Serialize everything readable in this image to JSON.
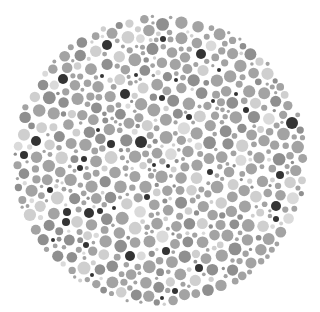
{
  "plate": {
    "type": "color-vision-test-plate",
    "rendering": "grayscale",
    "width": 318,
    "height": 312,
    "background": "#ffffff",
    "center": [
      160,
      160
    ],
    "radius_x": 148,
    "radius_y": 146,
    "palette": {
      "dark": "#343434",
      "mid": "#a3a3a3",
      "mid_dark": "#8f8f8f",
      "light": "#cfcfcf",
      "lighter": "#dadada"
    },
    "dark_dots": [
      [
        107,
        45,
        5
      ],
      [
        163,
        39,
        3
      ],
      [
        201,
        54,
        5
      ],
      [
        63,
        79,
        5
      ],
      [
        125,
        94,
        5
      ],
      [
        162,
        98,
        3
      ],
      [
        176,
        80,
        2
      ],
      [
        102,
        76,
        2
      ],
      [
        136,
        75,
        2
      ],
      [
        213,
        101,
        2
      ],
      [
        246,
        110,
        3
      ],
      [
        189,
        117,
        3
      ],
      [
        292,
        123,
        6
      ],
      [
        36,
        141,
        5
      ],
      [
        24,
        155,
        4
      ],
      [
        141,
        142,
        6
      ],
      [
        111,
        144,
        4
      ],
      [
        98,
        130,
        2
      ],
      [
        84,
        159,
        3
      ],
      [
        80,
        168,
        3
      ],
      [
        168,
        166,
        2
      ],
      [
        210,
        172,
        3
      ],
      [
        280,
        175,
        4
      ],
      [
        50,
        190,
        3
      ],
      [
        147,
        197,
        3
      ],
      [
        67,
        212,
        4
      ],
      [
        66,
        222,
        4
      ],
      [
        89,
        213,
        5
      ],
      [
        100,
        211,
        3
      ],
      [
        114,
        208,
        2
      ],
      [
        276,
        206,
        5
      ],
      [
        276,
        219,
        3
      ],
      [
        86,
        245,
        3
      ],
      [
        53,
        240,
        2
      ],
      [
        130,
        256,
        5
      ],
      [
        166,
        251,
        4
      ],
      [
        199,
        268,
        4
      ],
      [
        92,
        275,
        2
      ],
      [
        175,
        291,
        3
      ],
      [
        162,
        298,
        2
      ],
      [
        219,
        70,
        2
      ],
      [
        236,
        94,
        2
      ],
      [
        154,
        165,
        2
      ]
    ],
    "filler": {
      "seed": 7,
      "min_r": 1.6,
      "max_r": 6.5,
      "attempts": 9000,
      "gap": 1.1,
      "weights": {
        "mid": 0.62,
        "mid_dark": 0.16,
        "light": 0.15,
        "lighter": 0.07
      }
    },
    "hidden_figure": "none discernible"
  }
}
